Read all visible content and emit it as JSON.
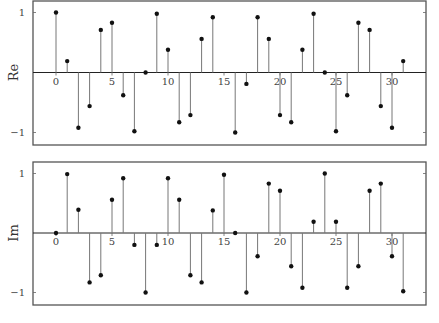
{
  "chart_data": [
    {
      "type": "stem",
      "title": "",
      "xlabel": "",
      "ylabel": "Re",
      "xlim": [
        -2,
        33
      ],
      "ylim": [
        -1.2,
        1.2
      ],
      "xticks": [
        0,
        5,
        10,
        15,
        20,
        25,
        30
      ],
      "xtick_labels": [
        "0",
        "5",
        "10",
        "15",
        "20",
        "25",
        "30"
      ],
      "yticks": [
        1,
        -1
      ],
      "ytick_labels": [
        "1",
        "−1"
      ],
      "grid": false,
      "legend": null,
      "x": [
        0,
        1,
        2,
        3,
        4,
        5,
        6,
        7,
        8,
        9,
        10,
        11,
        12,
        13,
        14,
        15,
        16,
        17,
        18,
        19,
        20,
        21,
        22,
        23,
        24,
        25,
        26,
        27,
        28,
        29,
        30,
        31
      ],
      "values": [
        1.0,
        0.19,
        -0.92,
        -0.56,
        0.71,
        0.83,
        -0.38,
        -0.98,
        0.0,
        0.98,
        0.38,
        -0.83,
        -0.71,
        0.56,
        0.92,
        0.0,
        -1.0,
        -0.19,
        0.92,
        0.56,
        -0.71,
        -0.83,
        0.38,
        0.98,
        0.0,
        -0.98,
        -0.38,
        0.83,
        0.71,
        -0.56,
        -0.92,
        0.19
      ],
      "hidden_markers": [
        15
      ]
    },
    {
      "type": "stem",
      "title": "",
      "xlabel": "",
      "ylabel": "Im",
      "xlim": [
        -2,
        33
      ],
      "ylim": [
        -1.2,
        1.2
      ],
      "xticks": [
        0,
        5,
        10,
        15,
        20,
        25,
        30
      ],
      "xtick_labels": [
        "0",
        "5",
        "10",
        "15",
        "20",
        "25",
        "30"
      ],
      "yticks": [
        1,
        -1
      ],
      "ytick_labels": [
        "1",
        "−1"
      ],
      "grid": false,
      "legend": null,
      "x": [
        0,
        1,
        2,
        3,
        4,
        5,
        6,
        7,
        8,
        9,
        10,
        11,
        12,
        13,
        14,
        15,
        16,
        17,
        18,
        19,
        20,
        21,
        22,
        23,
        24,
        25,
        26,
        27,
        28,
        29,
        30,
        31
      ],
      "values": [
        0.0,
        0.99,
        0.39,
        -0.83,
        -0.71,
        0.56,
        0.92,
        -0.2,
        -1.0,
        -0.2,
        0.92,
        0.56,
        -0.71,
        -0.83,
        0.38,
        0.98,
        0.0,
        -1.0,
        -0.39,
        0.83,
        0.71,
        -0.56,
        -0.92,
        0.19,
        1.0,
        0.19,
        -0.92,
        -0.56,
        0.71,
        0.83,
        -0.39,
        -0.98
      ],
      "hidden_markers": []
    }
  ],
  "layout": {
    "panels": [
      {
        "left": 33,
        "right": 426,
        "top": 1,
        "bottom": 145,
        "zero_y": 72.5,
        "unit_px": 60,
        "x0_px": 56,
        "x_unit_px": 11.2
      },
      {
        "left": 33,
        "right": 426,
        "top": 162,
        "bottom": 305,
        "zero_y": 233,
        "unit_px": 59.5,
        "x0_px": 56,
        "x_unit_px": 11.2
      }
    ]
  }
}
